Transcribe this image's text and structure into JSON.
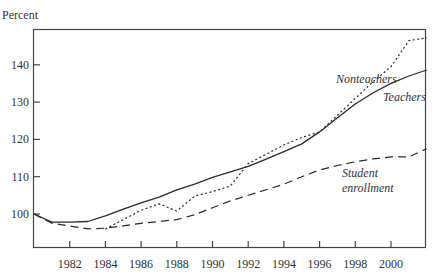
{
  "chart_data": {
    "type": "line",
    "title": "",
    "ylabel": "Percent",
    "xlabel": "",
    "xlim": [
      1980,
      2002
    ],
    "ylim": [
      90.5,
      149.5
    ],
    "grid": false,
    "legend_position": "inline annotations",
    "x_ticks": [
      1982,
      1984,
      1986,
      1988,
      1990,
      1992,
      1994,
      1996,
      1998,
      2000
    ],
    "y_ticks": [
      100,
      110,
      120,
      130,
      140
    ],
    "x": [
      1980,
      1981,
      1982,
      1983,
      1984,
      1985,
      1986,
      1987,
      1988,
      1989,
      1990,
      1991,
      1992,
      1993,
      1994,
      1995,
      1996,
      1997,
      1998,
      1999,
      2000,
      2001,
      2002
    ],
    "series": [
      {
        "name": "Teachers",
        "style": "solid",
        "values": [
          100,
          97.8,
          97.8,
          98,
          99.5,
          101.3,
          103,
          104.5,
          106.5,
          108,
          109.8,
          111.3,
          112.8,
          114.7,
          116.7,
          118.8,
          122,
          125.8,
          129.5,
          132.5,
          135,
          137,
          138.6
        ]
      },
      {
        "name": "Nonteachers",
        "style": "dotted",
        "values": [
          null,
          null,
          null,
          null,
          96,
          98.5,
          101,
          102.7,
          100.8,
          104.8,
          106,
          107.5,
          113.5,
          116,
          118.5,
          120.5,
          122,
          126.5,
          131,
          135.5,
          139.5,
          146.5,
          147.2
        ]
      },
      {
        "name": "Student enrollment",
        "style": "dashed",
        "values": [
          100,
          97.5,
          96.8,
          96,
          96.2,
          96.8,
          97.5,
          98,
          98.5,
          99.8,
          101.7,
          103.5,
          105,
          106.5,
          108,
          110,
          111.8,
          113,
          114,
          114.8,
          115.3,
          115.3,
          117.5
        ]
      }
    ],
    "annotations": [
      {
        "text": "Nonteachers",
        "x": 1999.3,
        "y": 143
      },
      {
        "text": "Teachers",
        "x": 2000.2,
        "y": 133
      },
      {
        "text": "Student",
        "x": 1997.5,
        "y": 111
      },
      {
        "text": "enrollment",
        "x": 1997.5,
        "y": 107
      }
    ]
  },
  "labels": {
    "ylabel": "Percent",
    "annotation_nonteachers": "Nonteachers",
    "annotation_teachers": "Teachers",
    "annotation_student_1": "Student",
    "annotation_student_2": "enrollment"
  }
}
